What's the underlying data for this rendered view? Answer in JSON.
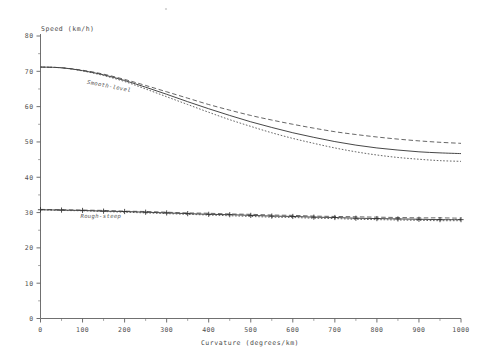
{
  "chart_data": {
    "type": "line",
    "title": "",
    "xlabel": "Curvature (degrees/km)",
    "ylabel": "Speed (km/h)",
    "xlim": [
      0,
      1000
    ],
    "ylim": [
      0,
      80
    ],
    "x_ticks": [
      0,
      100,
      200,
      300,
      400,
      500,
      600,
      700,
      800,
      900,
      1000
    ],
    "y_ticks": [
      0,
      10,
      20,
      30,
      40,
      50,
      60,
      70,
      80
    ],
    "x_minor_step": 50,
    "y_minor_step": 5,
    "grid": false,
    "legend": "inline-annotations",
    "annotations": [
      {
        "text": "Smooth-level",
        "x": 110,
        "y": 66.5
      },
      {
        "text": "Rough-steep",
        "x": 95,
        "y": 28.6
      }
    ],
    "x": [
      0,
      50,
      100,
      150,
      200,
      250,
      300,
      350,
      400,
      450,
      500,
      550,
      600,
      650,
      700,
      750,
      800,
      850,
      900,
      950,
      1000
    ],
    "series": [
      {
        "name": "Smooth-level upper",
        "group": "Smooth-level",
        "style": "dashed",
        "marker": "none",
        "values": [
          71.2,
          71.0,
          70.3,
          69.2,
          67.7,
          66.0,
          64.2,
          62.4,
          60.6,
          59.0,
          57.5,
          56.2,
          55.0,
          53.9,
          52.9,
          52.1,
          51.4,
          50.8,
          50.3,
          49.9,
          49.6
        ]
      },
      {
        "name": "Smooth-level central",
        "group": "Smooth-level",
        "style": "solid",
        "marker": "none",
        "values": [
          71.2,
          71.0,
          70.2,
          69.0,
          67.4,
          65.5,
          63.5,
          61.4,
          59.4,
          57.5,
          55.7,
          54.1,
          52.6,
          51.3,
          50.1,
          49.1,
          48.3,
          47.7,
          47.2,
          46.9,
          46.7
        ]
      },
      {
        "name": "Smooth-level lower",
        "group": "Smooth-level",
        "style": "dotted",
        "marker": "none",
        "values": [
          71.2,
          71.0,
          70.1,
          68.8,
          67.1,
          65.0,
          62.8,
          60.6,
          58.4,
          56.3,
          54.4,
          52.6,
          51.0,
          49.6,
          48.3,
          47.2,
          46.3,
          45.6,
          45.1,
          44.7,
          44.5
        ]
      },
      {
        "name": "Rough-steep upper",
        "group": "Rough-steep",
        "style": "dashed",
        "marker": "none",
        "values": [
          30.9,
          30.8,
          30.7,
          30.6,
          30.4,
          30.3,
          30.1,
          29.9,
          29.8,
          29.6,
          29.5,
          29.3,
          29.2,
          29.0,
          28.9,
          28.8,
          28.7,
          28.6,
          28.5,
          28.5,
          28.4
        ]
      },
      {
        "name": "Rough-steep central",
        "group": "Rough-steep",
        "style": "solid",
        "marker": "plus",
        "values": [
          30.8,
          30.7,
          30.6,
          30.4,
          30.3,
          30.1,
          29.9,
          29.7,
          29.5,
          29.4,
          29.2,
          29.0,
          28.9,
          28.7,
          28.6,
          28.4,
          28.3,
          28.2,
          28.1,
          28.0,
          28.0
        ]
      },
      {
        "name": "Rough-steep lower",
        "group": "Rough-steep",
        "style": "dotted",
        "marker": "none",
        "values": [
          30.8,
          30.6,
          30.5,
          30.3,
          30.1,
          29.9,
          29.7,
          29.5,
          29.3,
          29.1,
          28.9,
          28.7,
          28.6,
          28.4,
          28.3,
          28.1,
          28.0,
          27.9,
          27.8,
          27.7,
          27.7
        ]
      }
    ]
  },
  "colors": {
    "ink": "#3d3d3d",
    "axis": "#606060",
    "background": "#ffffff"
  }
}
